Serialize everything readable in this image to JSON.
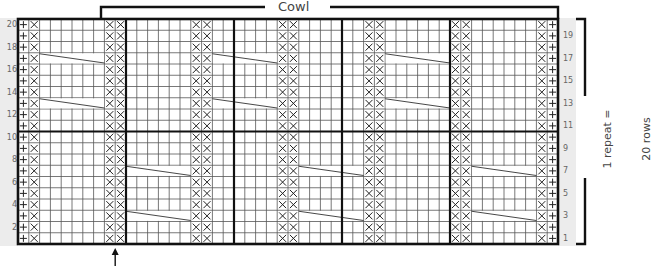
{
  "chart": {
    "title": "Cowl",
    "side_label_line1": "1 repeat =",
    "side_label_line2": "20 rows",
    "rows": 20,
    "cols": 50,
    "left_row_labels": [
      "20",
      "18",
      "16",
      "14",
      "12",
      "10",
      "8",
      "6",
      "4",
      "2"
    ],
    "right_row_labels": [
      "19",
      "17",
      "15",
      "13",
      "11",
      "9",
      "7",
      "5",
      "3",
      "1"
    ],
    "symbols": {
      "plus": "+",
      "cross": "X"
    },
    "column_pattern": {
      "col_0": "+",
      "col_49": "+",
      "cross_cols": [
        1,
        8,
        9,
        16,
        17,
        24,
        25,
        32,
        33,
        40,
        41,
        48
      ]
    },
    "cables_top_half": {
      "rows": [
        17,
        13
      ],
      "col_ranges": [
        [
          2,
          7
        ],
        [
          18,
          23
        ],
        [
          34,
          39
        ]
      ]
    },
    "cables_bottom_half": {
      "rows": [
        7,
        3
      ],
      "col_ranges": [
        [
          10,
          15
        ],
        [
          26,
          31
        ],
        [
          42,
          47
        ]
      ]
    },
    "thick_vertical_after_cols": [
      9,
      19,
      29,
      39
    ],
    "thick_horizontal_between_rows": [
      10,
      11
    ],
    "arrow_marker": "up-arrow",
    "arrow_col": 9
  }
}
